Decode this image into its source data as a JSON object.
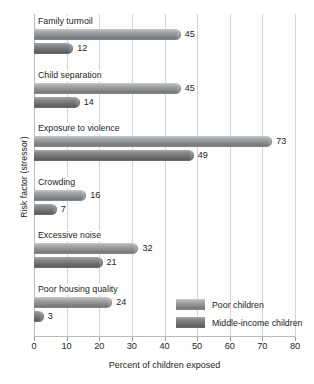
{
  "chart_data": {
    "type": "bar",
    "orientation": "horizontal",
    "title": "",
    "xlabel": "Percent of children exposed",
    "ylabel": "Risk factor (stressor)",
    "xlim": [
      0,
      80
    ],
    "xticks": [
      0,
      10,
      20,
      30,
      40,
      50,
      60,
      70,
      80
    ],
    "grid": true,
    "legend_position": "inside-lower-right",
    "categories": [
      "Family turmoil",
      "Child separation",
      "Exposure to violence",
      "Crowding",
      "Excessive noise",
      "Poor housing quality"
    ],
    "series": [
      {
        "name": "Poor children",
        "color": "#8e9092",
        "values": [
          45,
          45,
          73,
          16,
          32,
          24
        ]
      },
      {
        "name": "Middle-income children",
        "color": "#717375",
        "values": [
          12,
          14,
          49,
          7,
          21,
          3
        ]
      }
    ]
  },
  "legend": {
    "items": [
      {
        "label": "Poor children"
      },
      {
        "label": "Middle-income children"
      }
    ]
  },
  "axes": {
    "x_title": "Percent of children exposed",
    "y_title": "Risk factor (stressor)",
    "x_tick_labels": [
      "0",
      "10",
      "20",
      "30",
      "40",
      "50",
      "60",
      "70",
      "80"
    ]
  },
  "colors": {
    "series_poor": "#8e9092",
    "series_middle": "#717375",
    "gridline": "#d2d4d6",
    "axis": "#b9bbbd",
    "text": "#231f20",
    "background": "#ffffff"
  }
}
